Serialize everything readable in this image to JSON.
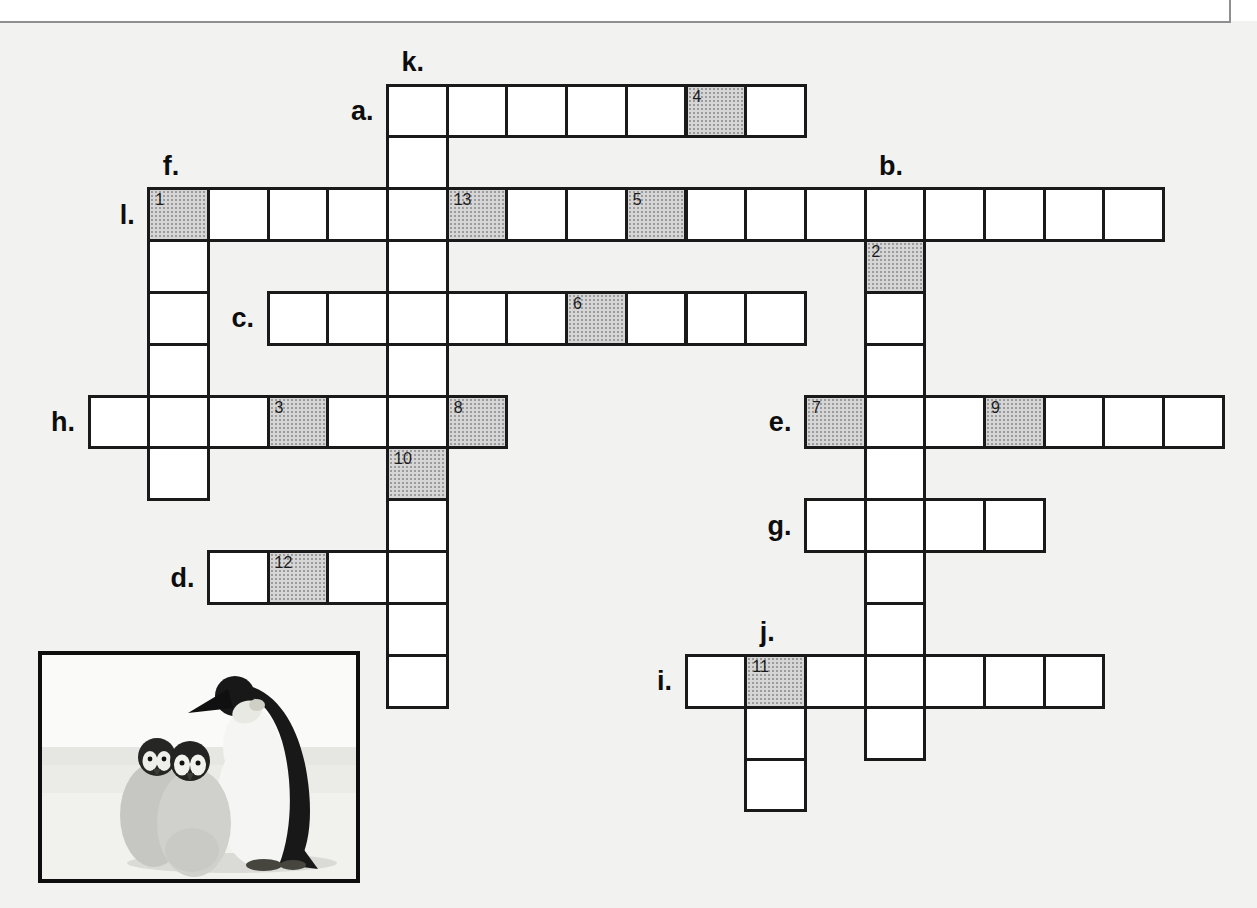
{
  "page": {
    "background": "#f2f2f0",
    "top_edge_color": "#8f8f8f"
  },
  "puzzle": {
    "grid_line_color": "#1a1a1a",
    "cell_fill": "#ffffff",
    "shade_fill": "#d6d6d6",
    "shade_dot_color": "#9b9b9b",
    "words": [
      {
        "label": "a.",
        "dir": "across",
        "col": 5,
        "row": 0,
        "len": 7,
        "label_side": "left",
        "numbers": [
          {
            "offset": 5,
            "num": "4"
          }
        ]
      },
      {
        "label": "b.",
        "dir": "down",
        "col": 13,
        "row": 2,
        "len": 11,
        "label_side": "top",
        "numbers": [
          {
            "offset": 1,
            "num": "2"
          }
        ]
      },
      {
        "label": "c.",
        "dir": "across",
        "col": 3,
        "row": 4,
        "len": 9,
        "label_side": "left",
        "numbers": [
          {
            "offset": 5,
            "num": "6"
          }
        ]
      },
      {
        "label": "d.",
        "dir": "across",
        "col": 2,
        "row": 9,
        "len": 4,
        "label_side": "left",
        "numbers": [
          {
            "offset": 1,
            "num": "12"
          }
        ]
      },
      {
        "label": "e.",
        "dir": "across",
        "col": 12,
        "row": 6,
        "len": 7,
        "label_side": "left",
        "numbers": [
          {
            "offset": 0,
            "num": "7"
          },
          {
            "offset": 3,
            "num": "9"
          }
        ]
      },
      {
        "label": "f.",
        "dir": "down",
        "col": 1,
        "row": 2,
        "len": 6,
        "label_side": "top",
        "numbers": []
      },
      {
        "label": "g.",
        "dir": "across",
        "col": 12,
        "row": 8,
        "len": 4,
        "label_side": "left",
        "numbers": []
      },
      {
        "label": "h.",
        "dir": "across",
        "col": 0,
        "row": 6,
        "len": 7,
        "label_side": "left",
        "numbers": [
          {
            "offset": 3,
            "num": "3"
          },
          {
            "offset": 6,
            "num": "8"
          }
        ]
      },
      {
        "label": "i.",
        "dir": "across",
        "col": 10,
        "row": 11,
        "len": 7,
        "label_side": "left",
        "numbers": [
          {
            "offset": 1,
            "num": "11"
          }
        ]
      },
      {
        "label": "j.",
        "dir": "down",
        "col": 11,
        "row": 11,
        "len": 3,
        "label_side": "top",
        "numbers": []
      },
      {
        "label": "k.",
        "dir": "down",
        "col": 5,
        "row": 0,
        "len": 12,
        "label_side": "top",
        "numbers": [
          {
            "offset": 7,
            "num": "10"
          }
        ]
      },
      {
        "label": "l.",
        "dir": "across",
        "col": 1,
        "row": 2,
        "len": 17,
        "label_side": "left",
        "numbers": [
          {
            "offset": 0,
            "num": "1"
          },
          {
            "offset": 5,
            "num": "13"
          },
          {
            "offset": 8,
            "num": "5"
          }
        ]
      }
    ]
  },
  "photo": {
    "description": "emperor penguin adult with two chicks on snow"
  }
}
